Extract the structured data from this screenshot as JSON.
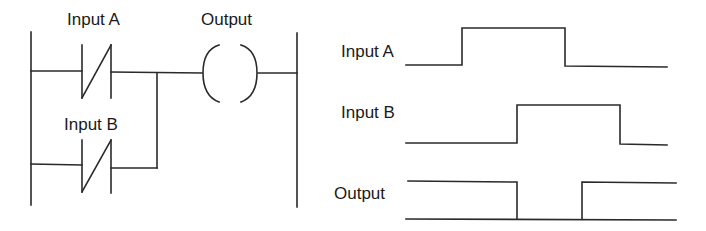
{
  "ladder": {
    "contact_a_label": "Input A",
    "contact_b_label": "Input B",
    "coil_label": "Output",
    "contact_type": "normally-closed",
    "logic": "Output = NOT A OR NOT B (NAND)"
  },
  "timing": {
    "signals": [
      {
        "label": "Input A",
        "pattern": "low-high-low"
      },
      {
        "label": "Input B",
        "pattern": "low-high-low"
      },
      {
        "label": "Output",
        "pattern": "high-low-high"
      }
    ]
  },
  "colors": {
    "line": "#2a2a2a",
    "text": "#1a1a1a",
    "background": "#ffffff"
  }
}
